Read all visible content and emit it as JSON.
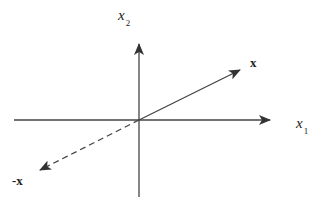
{
  "diagram": {
    "type": "vector-diagram",
    "colors": {
      "line": "#444444",
      "text": "#222222",
      "background": "#ffffff"
    },
    "origin": [
      139,
      120
    ],
    "axes": [
      {
        "id": "x1",
        "label_main": "x",
        "label_sub": "1",
        "from": [
          14,
          120
        ],
        "to": [
          270,
          120
        ],
        "label_pos": [
          296,
          128
        ]
      },
      {
        "id": "x2",
        "label_main": "x",
        "label_sub": "2",
        "from": [
          139,
          197
        ],
        "to": [
          139,
          44
        ],
        "label_pos": [
          118,
          20
        ]
      }
    ],
    "vectors": [
      {
        "id": "x",
        "label": "x",
        "style": "solid",
        "from": [
          139,
          120
        ],
        "to": [
          240,
          70
        ],
        "label_pos": [
          250,
          67
        ]
      },
      {
        "id": "neg-x",
        "label": "-x",
        "style": "dashed",
        "from": [
          139,
          120
        ],
        "to": [
          40,
          170
        ],
        "label_pos": [
          12,
          185
        ]
      }
    ]
  }
}
